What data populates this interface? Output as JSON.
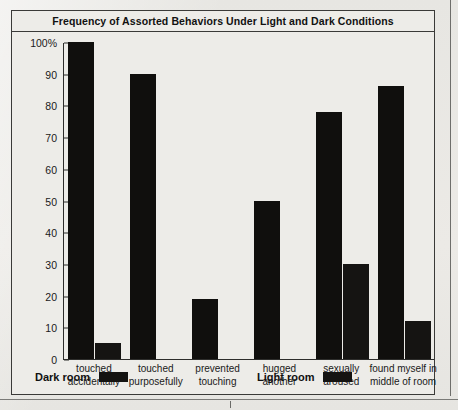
{
  "chart_data": {
    "type": "bar",
    "title": "Frequency of Assorted Behaviors Under Light and Dark Conditions",
    "xlabel": "",
    "ylabel": "",
    "ylim": [
      0,
      100
    ],
    "yticks": [
      0,
      10,
      20,
      30,
      40,
      50,
      60,
      70,
      80,
      90,
      100
    ],
    "ytick_labels": [
      "0",
      "10",
      "20",
      "30",
      "40",
      "50",
      "60",
      "70",
      "80",
      "90",
      "100%"
    ],
    "grid": false,
    "legend_position": "bottom",
    "categories": [
      "touched\naccidentally",
      "touched\npurposefully",
      "prevented\ntouching",
      "hugged\nanother",
      "sexually\naroused",
      "found myself in\nmiddle of room"
    ],
    "category_lines": [
      [
        "touched",
        "accidentally"
      ],
      [
        "touched",
        "purposefully"
      ],
      [
        "prevented",
        "touching"
      ],
      [
        "hugged",
        "another"
      ],
      [
        "sexually",
        "aroused"
      ],
      [
        "found myself in",
        "middle of room"
      ]
    ],
    "series": [
      {
        "name": "Dark room",
        "color": "#100f0d",
        "values": [
          100,
          90,
          19,
          50,
          78,
          86
        ]
      },
      {
        "name": "Light room",
        "color": "#151412",
        "values": [
          5,
          0,
          0,
          0,
          30,
          12
        ]
      }
    ]
  },
  "legend": {
    "entries": [
      {
        "label": "Dark room",
        "swatch_color": "#141311"
      },
      {
        "label": "Light room",
        "swatch_color": "#141311"
      }
    ]
  },
  "figure": {
    "frame_color": "#3a3a38",
    "axis_color": "#2d2d2b",
    "background": "#edecE8",
    "page_background": "#e9e8e4"
  }
}
